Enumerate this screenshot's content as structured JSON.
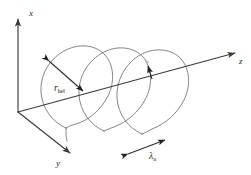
{
  "figure": {
    "background_color": "#ffffff",
    "axis_color": "#3c3c3c",
    "helix_color": "#6e6e78",
    "annotation_color": "#222222",
    "origin": {
      "x": 18,
      "y": 112
    }
  },
  "axes": [
    {
      "id": "x",
      "label": "x",
      "label_pos": {
        "x": 30,
        "y": 14
      },
      "start": {
        "x": 18,
        "y": 112
      },
      "end": {
        "x": 18,
        "y": 16
      },
      "direction": "up"
    },
    {
      "id": "y",
      "label": "y",
      "label_pos": {
        "x": 58,
        "y": 163
      },
      "start": {
        "x": 18,
        "y": 112
      },
      "end": {
        "x": 72,
        "y": 155
      },
      "direction": "down-right"
    },
    {
      "id": "z",
      "label": "z",
      "label_pos": {
        "x": 240,
        "y": 62
      },
      "start": {
        "x": 18,
        "y": 112
      },
      "end": {
        "x": 238,
        "y": 52
      },
      "direction": "up-right"
    }
  ],
  "annotations": [
    {
      "id": "r-hel",
      "label": "r",
      "subscript": "hel",
      "meaning": "helix radius",
      "label_pos": {
        "x": 55,
        "y": 88
      },
      "arrow_start": {
        "x": 46,
        "y": 58
      },
      "arrow_end": {
        "x": 86,
        "y": 94
      },
      "arrowheads": "both"
    },
    {
      "id": "lambda-u",
      "label": "λ",
      "subscript": "u",
      "meaning": "undulator period",
      "label_pos": {
        "x": 152,
        "y": 158
      },
      "arrow_start": {
        "x": 125,
        "y": 155
      },
      "arrow_end": {
        "x": 168,
        "y": 138
      },
      "arrowheads": "both"
    },
    {
      "id": "center-marker",
      "label": "",
      "meaning": "helix axis centre marker with small pointer",
      "dot_pos": {
        "x": 147,
        "y": 62
      },
      "pointer_start": {
        "x": 152,
        "y": 78
      },
      "pointer_end": {
        "x": 148,
        "y": 63
      },
      "arrowheads": "end"
    }
  ],
  "helix": {
    "turns": 3,
    "radius_px": 44,
    "period_px": 38,
    "tilt_deg": -15,
    "squash": 0.88,
    "start_phase_deg": 200,
    "axis": "z",
    "tail_visible": true
  }
}
